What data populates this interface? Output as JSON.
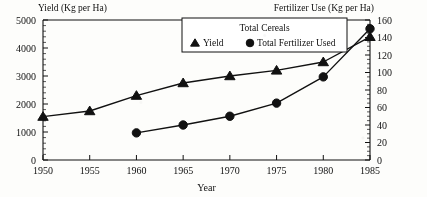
{
  "chart_data": {
    "type": "line",
    "title": "",
    "xlabel": "Year",
    "ylabel": "Yield (Kg per Ha)",
    "y2label": "Fertilizer Use (Kg per Ha)",
    "legend_title": "Total Cereals",
    "legend_position": "top-center-inside",
    "grid": false,
    "x": [
      1950,
      1955,
      1960,
      1965,
      1970,
      1975,
      1980,
      1985
    ],
    "xlim": [
      1950,
      1985
    ],
    "xticks": [
      "1950",
      "1955",
      "1960",
      "1965",
      "1970",
      "1975",
      "1980",
      "1985"
    ],
    "ylim": [
      0,
      5000
    ],
    "yticks": [
      "0",
      "1000",
      "2000",
      "3000",
      "4000",
      "5000"
    ],
    "y2lim": [
      0,
      160
    ],
    "y2ticks": [
      "0",
      "20",
      "40",
      "60",
      "80",
      "100",
      "120",
      "140",
      "160"
    ],
    "series": [
      {
        "name": "Yield",
        "marker": "triangle",
        "axis": "left",
        "x": [
          1950,
          1955,
          1960,
          1965,
          1970,
          1975,
          1980,
          1985
        ],
        "values": [
          1550,
          1750,
          2300,
          2750,
          3000,
          3200,
          3500,
          4400
        ]
      },
      {
        "name": "Total Fertilizer Used",
        "marker": "circle",
        "axis": "right",
        "x": [
          1960,
          1965,
          1970,
          1975,
          1980,
          1985
        ],
        "values": [
          31,
          40,
          50,
          65,
          95,
          150
        ]
      }
    ]
  },
  "axes": {
    "left_title": "Yield (Kg per Ha)",
    "right_title": "Fertilizer Use (Kg per Ha)",
    "x_title": "Year"
  },
  "legend": {
    "title": "Total Cereals",
    "items": [
      {
        "label": "Yield",
        "marker": "triangle-marker-icon"
      },
      {
        "label": "Total Fertilizer Used",
        "marker": "circle-marker-icon"
      }
    ]
  },
  "colors": {
    "ink": "#111111",
    "paper": "#fdfdfb"
  }
}
